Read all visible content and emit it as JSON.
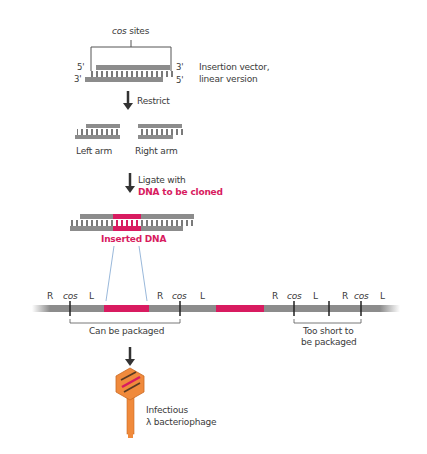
{
  "colors": {
    "strand": "#8c8c8c",
    "tick": "#7a7a7a",
    "insert": "#d81b60",
    "arrow": "#333333",
    "line": "#555555",
    "phage_head": "#f08a3c",
    "phage_dark": "#5a3a22",
    "guide_line": "#7fa6d0"
  },
  "step1": {
    "cos_label": "cos",
    "sites_label": "sites",
    "end_5_top": "5'",
    "end_3_top": "3'",
    "end_3_bottom": "3'",
    "end_5_bottom": "5'",
    "vector_label_line1": "Insertion vector,",
    "vector_label_line2": "linear version"
  },
  "step2": {
    "arrow_label": "Restrict",
    "left_arm": "Left arm",
    "right_arm": "Right arm"
  },
  "step3": {
    "arrow_label_line1": "Ligate with",
    "arrow_label_line2": "DNA to be cloned",
    "inserted_label": "Inserted DNA"
  },
  "concatemer": {
    "markers": [
      {
        "R": "R",
        "cos": "cos",
        "L": "L"
      },
      {
        "R": "R",
        "cos": "cos",
        "L": "L"
      },
      {
        "R": "R",
        "cos": "cos",
        "L": "L"
      },
      {
        "R": "R",
        "cos": "cos",
        "L": "L"
      }
    ],
    "can_be_packaged": "Can be packaged",
    "too_short_line1": "Too short to",
    "too_short_line2": "be packaged"
  },
  "result": {
    "label_line1": "Infectious",
    "label_line2": "λ bacteriophage"
  }
}
